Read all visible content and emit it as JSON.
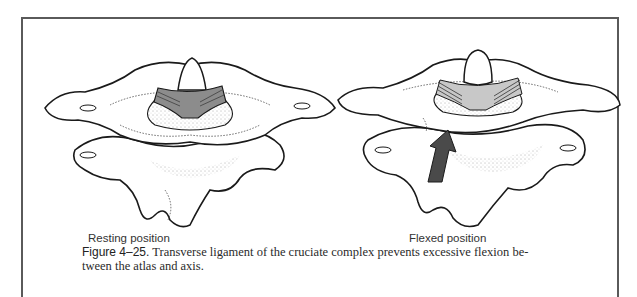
{
  "figure": {
    "number_label": "Figure 4–25.",
    "caption_line1": " Transverse ligament of the cruciate complex prevents excessive flexion be-",
    "caption_line2": "tween the atlas and axis.",
    "panels": [
      {
        "label": "Resting position",
        "illustration": "atlas-axis-resting",
        "ligament_color": "#8c8c8c"
      },
      {
        "label": "Flexed position",
        "illustration": "atlas-axis-flexed",
        "ligament_color": "#c8c8c8",
        "arrow_color": "#4a4a4a"
      }
    ]
  }
}
